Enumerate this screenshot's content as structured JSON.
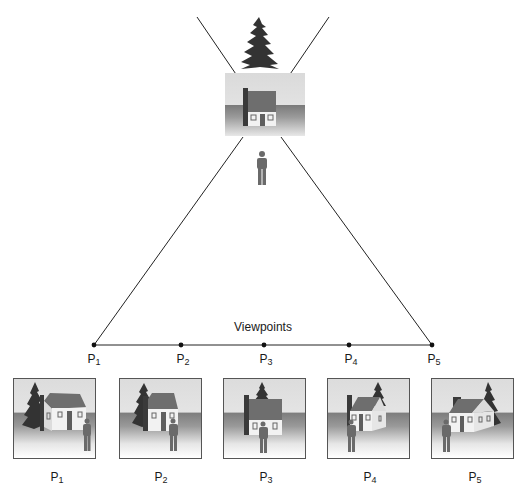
{
  "diagram": {
    "title": "Viewpoints",
    "baseline_points": [
      {
        "id": "P1",
        "letter": "P",
        "index": "1",
        "x": 94,
        "y": 345
      },
      {
        "id": "P2",
        "letter": "P",
        "index": "2",
        "x": 181,
        "y": 345
      },
      {
        "id": "P3",
        "letter": "P",
        "index": "3",
        "x": 264,
        "y": 345
      },
      {
        "id": "P4",
        "letter": "P",
        "index": "4",
        "x": 349,
        "y": 345
      },
      {
        "id": "P5",
        "letter": "P",
        "index": "5",
        "x": 432,
        "y": 345
      }
    ],
    "scene": {
      "elements": [
        "tree",
        "house",
        "person"
      ],
      "description": "Top view scene: a pine tree behind a house with a person standing in front, viewed from five viewpoints along a line"
    },
    "frames": [
      {
        "id": "frame-P1",
        "letter": "P",
        "index": "1",
        "x": 13,
        "view": "left-oblique"
      },
      {
        "id": "frame-P2",
        "letter": "P",
        "index": "2",
        "x": 119,
        "view": "left-slight"
      },
      {
        "id": "frame-P3",
        "letter": "P",
        "index": "3",
        "x": 223,
        "view": "front"
      },
      {
        "id": "frame-P4",
        "letter": "P",
        "index": "4",
        "x": 327,
        "view": "right-slight"
      },
      {
        "id": "frame-P5",
        "letter": "P",
        "index": "5",
        "x": 431,
        "view": "right-oblique"
      }
    ],
    "colors": {
      "line": "#222222",
      "roof": "#6e6e6e",
      "wall": "#f2f2f2",
      "chimney": "#3a3a3a",
      "tree": "#2e2e2e",
      "person": "#6a6a6a",
      "door": "#5e5e5e"
    }
  }
}
